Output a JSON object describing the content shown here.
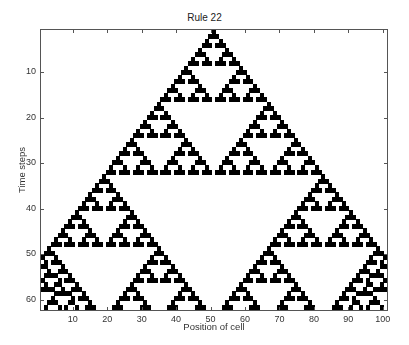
{
  "chart_data": {
    "type": "heatmap",
    "title": "Rule 22",
    "xlabel": "Position of cell",
    "ylabel": "Time steps",
    "rule": 22,
    "num_cells": 101,
    "num_steps": 62,
    "initial_condition": "single black cell at position 51",
    "boundary": "periodic",
    "colormap": {
      "0": "#ffffff",
      "1": "#000000"
    },
    "xlim": [
      0.5,
      101.5
    ],
    "ylim": [
      0.5,
      62.5
    ],
    "y_reversed": true,
    "xticks": [
      10,
      20,
      30,
      40,
      50,
      60,
      70,
      80,
      90,
      100
    ],
    "yticks": [
      10,
      20,
      30,
      40,
      50,
      60
    ],
    "grid": false
  },
  "labels": {
    "title": "Rule 22",
    "xlabel": "Position of cell",
    "ylabel": "Time steps"
  }
}
